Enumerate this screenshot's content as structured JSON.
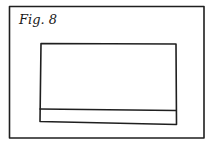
{
  "figure": {
    "label": "Fig. 8",
    "elements": [
      {
        "name": "outer-frame",
        "shape": "rectangle"
      },
      {
        "name": "inner-rectangle",
        "shape": "rectangle"
      },
      {
        "name": "bottom-strip",
        "shape": "horizontal band inside lower part of inner rectangle"
      }
    ]
  },
  "colors": {
    "background": "#ffffff",
    "ink": "#1f1f1f"
  }
}
